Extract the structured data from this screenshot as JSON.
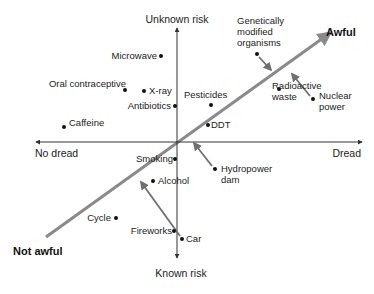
{
  "diagram": {
    "colors": {
      "axis": "#333333",
      "diagonal": "#8a8a8a",
      "arrow": "#6f6f6f",
      "dot": "#111111",
      "text": "#222222"
    },
    "axes": {
      "origin": {
        "x": 177,
        "y": 142
      },
      "x_axis": {
        "x1": 36,
        "x2": 362,
        "y": 142
      },
      "y_axis": {
        "x": 177,
        "y1": 28,
        "y2": 258
      },
      "labels": {
        "top": "Unknown risk",
        "bottom": "Known risk",
        "left": "No dread",
        "right": "Dread"
      }
    },
    "diagonal": {
      "x1": 46,
      "y1": 237,
      "x2": 330,
      "y2": 33,
      "start_label": "Not awful",
      "end_label": "Awful"
    },
    "points": [
      {
        "id": "microwave",
        "label": "Microwave",
        "x": 161,
        "y": 56
      },
      {
        "id": "oral-contraceptive",
        "label": "Oral contraceptive",
        "x": 125,
        "y": 90
      },
      {
        "id": "x-ray",
        "label": "X-ray",
        "x": 144,
        "y": 91
      },
      {
        "id": "antibiotics",
        "label": "Antibiotics",
        "x": 175,
        "y": 106
      },
      {
        "id": "caffeine",
        "label": "Caffeine",
        "x": 64,
        "y": 127
      },
      {
        "id": "pesticides",
        "label": "Pesticides",
        "x": 211,
        "y": 105
      },
      {
        "id": "ddt",
        "label": "DDT",
        "x": 208,
        "y": 125
      },
      {
        "id": "genetically-modified-organisms",
        "label": "Genetically modified organisms",
        "x": 257,
        "y": 54
      },
      {
        "id": "radioactive-waste",
        "label": "Radioactive waste",
        "x": 279,
        "y": 89
      },
      {
        "id": "nuclear-power",
        "label": "Nuclear power",
        "x": 313,
        "y": 99
      },
      {
        "id": "hydropower-dam",
        "label": "Hydropower dam",
        "x": 215,
        "y": 169
      },
      {
        "id": "smoking",
        "label": "Smoking",
        "x": 175,
        "y": 159
      },
      {
        "id": "alcohol",
        "label": "Alcohol",
        "x": 153,
        "y": 181
      },
      {
        "id": "cycle",
        "label": "Cycle",
        "x": 116,
        "y": 218
      },
      {
        "id": "fireworks",
        "label": "Fireworks",
        "x": 174,
        "y": 231
      },
      {
        "id": "car",
        "label": "Car",
        "x": 182,
        "y": 239
      }
    ],
    "arrows": [
      {
        "id": "gmo-arrow",
        "from": "Genetically modified organisms",
        "x1": 259,
        "y1": 57,
        "x2": 271,
        "y2": 70
      },
      {
        "id": "nuclear-arrow",
        "from": "Nuclear power",
        "x1": 310,
        "y1": 96,
        "x2": 292,
        "y2": 74
      },
      {
        "id": "hydro-arrow",
        "from": "Hydropower dam",
        "x1": 212,
        "y1": 166,
        "x2": 194,
        "y2": 143
      },
      {
        "id": "car-arrow",
        "from": "Car",
        "x1": 180,
        "y1": 236,
        "x2": 141,
        "y2": 182
      }
    ]
  }
}
